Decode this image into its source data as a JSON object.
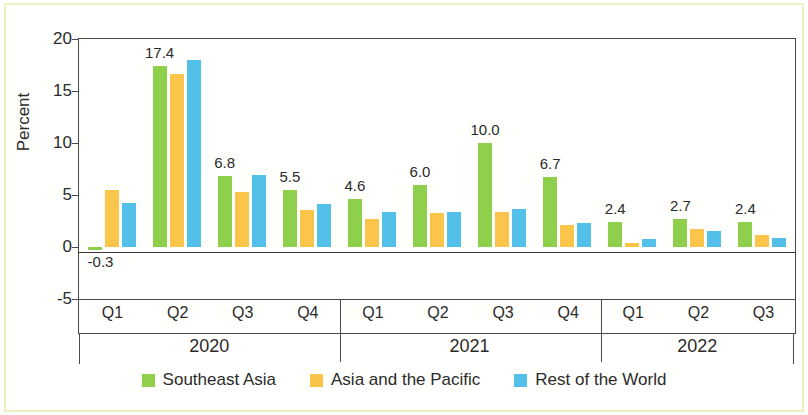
{
  "chart_data": {
    "type": "bar",
    "title": "",
    "xlabel": "",
    "ylabel": "Percent",
    "ylim": [
      -5,
      20
    ],
    "yticks": [
      "20",
      "15",
      "10",
      "5",
      "0",
      "-5"
    ],
    "grid": false,
    "legend_position": "bottom",
    "categories": [
      "Q1",
      "Q2",
      "Q3",
      "Q4",
      "Q1",
      "Q2",
      "Q3",
      "Q4",
      "Q1",
      "Q2",
      "Q3"
    ],
    "group_labels": [
      "2020",
      "2021",
      "2022"
    ],
    "group_sizes": [
      4,
      4,
      3
    ],
    "series": [
      {
        "name": "Southeast Asia",
        "color": "#8ED04C",
        "values": [
          -0.3,
          17.4,
          6.8,
          5.5,
          4.6,
          6.0,
          10.0,
          6.7,
          2.4,
          2.7,
          2.4
        ],
        "labels": [
          "-0.3",
          "17.4",
          "6.8",
          "5.5",
          "4.6",
          "6.0",
          "10.0",
          "6.7",
          "2.4",
          "2.7",
          "2.4"
        ]
      },
      {
        "name": "Asia and the Pacific",
        "color": "#FBC44B",
        "values": [
          5.5,
          16.6,
          5.3,
          3.6,
          2.7,
          3.3,
          3.4,
          2.1,
          0.4,
          1.7,
          1.2
        ]
      },
      {
        "name": "Rest of the World",
        "color": "#53C0E9",
        "values": [
          4.2,
          18.0,
          6.9,
          4.1,
          3.4,
          3.4,
          3.7,
          2.3,
          0.8,
          1.5,
          0.9
        ]
      }
    ]
  }
}
